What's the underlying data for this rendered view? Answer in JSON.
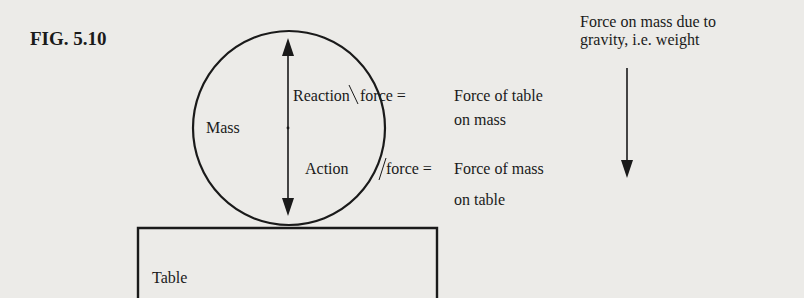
{
  "figure": {
    "label": "FIG. 5.10"
  },
  "labels": {
    "mass": "Mass",
    "table": "Table",
    "reaction": "Reaction",
    "reaction_force": "force =",
    "reaction_desc_line1": "Force of table",
    "reaction_desc_line2": "on mass",
    "action": "Action",
    "action_force": "force =",
    "action_desc_line1": "Force of mass",
    "action_desc_line2": "on table",
    "gravity_line1": "Force on mass due to",
    "gravity_line2": "gravity, i.e. weight"
  },
  "colors": {
    "background": "#ecebe8",
    "ink": "#1a1a1a"
  }
}
